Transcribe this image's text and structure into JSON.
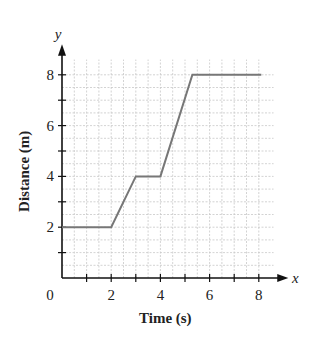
{
  "chart_data": {
    "type": "line",
    "title": "",
    "xlabel": "Time (s)",
    "ylabel": "Distance (m)",
    "x_axis_symbol": "x",
    "y_axis_symbol": "y",
    "origin_label": "0",
    "xlim": [
      0,
      8.5
    ],
    "ylim": [
      0,
      8.5
    ],
    "x_ticks": [
      2,
      4,
      6,
      8
    ],
    "y_ticks": [
      2,
      4,
      6,
      8
    ],
    "grid": true,
    "series": [
      {
        "name": "distance",
        "color": "#777777",
        "x": [
          0,
          2,
          3,
          4,
          5.3,
          8.1
        ],
        "y": [
          2,
          2,
          4,
          4,
          8,
          8
        ]
      }
    ]
  }
}
